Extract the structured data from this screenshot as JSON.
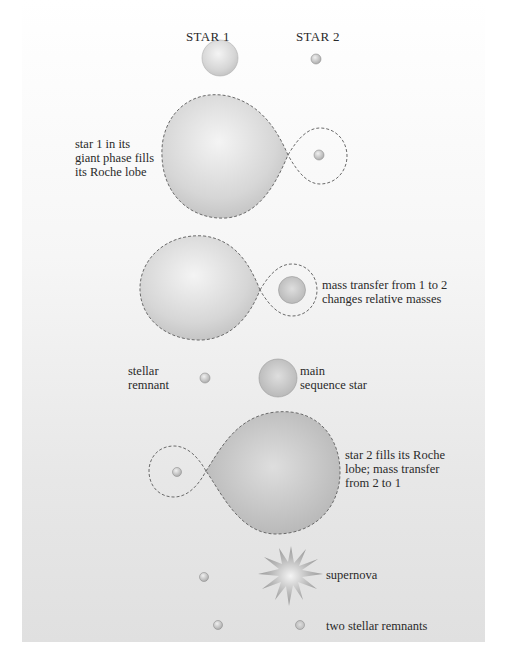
{
  "headers": {
    "star1": "STAR 1",
    "star2": "STAR 2"
  },
  "stages": [
    {
      "id": "initial",
      "label": ""
    },
    {
      "id": "giant-phase",
      "label": "star 1 in its\ngiant phase fills\nits Roche lobe"
    },
    {
      "id": "mass-transfer-1-to-2",
      "label": "mass transfer from 1 to 2\nchanges relative masses"
    },
    {
      "id": "after-transfer",
      "label_left": "stellar\nremnant",
      "label_right": "main\nsequence star"
    },
    {
      "id": "star2-fills-lobe",
      "label": "star 2 fills its Roche\nlobe; mass transfer\nfrom 2 to 1"
    },
    {
      "id": "supernova",
      "label": "supernova"
    },
    {
      "id": "final",
      "label": "two stellar remnants"
    }
  ],
  "colors": {
    "star_fill_light": "#f2f2f2",
    "star_fill_dark": "#bdbdbd",
    "lobe_outline": "#6a6a6a",
    "background_top": "#ffffff",
    "background_bottom": "#e0e0e0"
  }
}
